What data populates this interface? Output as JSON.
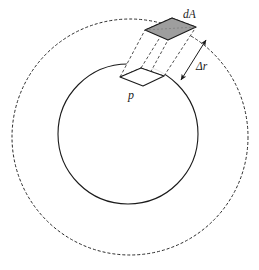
{
  "figure": {
    "labels": {
      "outer_patch": "dA",
      "shell_thickness": "Δr",
      "inner_point": "p"
    },
    "colors": {
      "stroke": "#1a1a1a",
      "outer_patch_fill": "#9e9e9e",
      "inner_patch_fill": "#ffffff",
      "background": "#ffffff"
    },
    "geometry": {
      "inner_sphere": {
        "cx": 128,
        "cy": 134,
        "r": 70,
        "style": "solid"
      },
      "outer_sphere": {
        "cx": 130,
        "cy": 137,
        "r": 118,
        "style": "dashed"
      },
      "inner_patch_points": "120,77 141,68 164,76 143,86",
      "outer_patch_points": "145,30 172,18 196,27 168,40",
      "thickness_arrow": {
        "x1": 206,
        "y1": 40,
        "x2": 181,
        "y2": 80
      }
    },
    "dash_pattern": "3 2"
  }
}
